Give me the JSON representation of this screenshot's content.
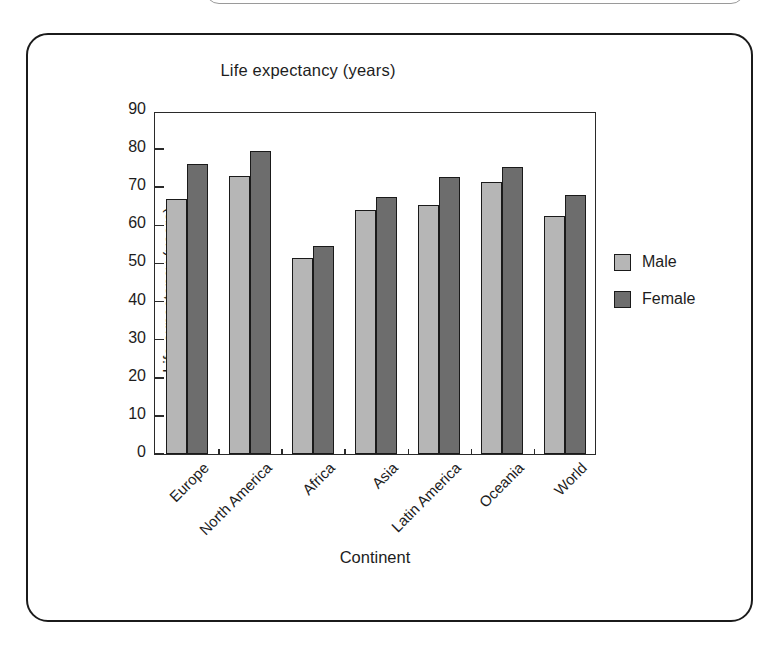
{
  "figure": {
    "title": "Life expectancy (years)"
  },
  "legend": {
    "position": "right",
    "items": [
      {
        "label": "Male",
        "color": "#b6b6b6"
      },
      {
        "label": "Female",
        "color": "#6d6d6d"
      }
    ]
  },
  "chart_data": {
    "type": "bar",
    "title": "Life expectancy (years)",
    "xlabel": "Continent",
    "ylabel": "Life expectancy (years)",
    "categories": [
      "Europe",
      "North America",
      "Africa",
      "Asia",
      "Latin America",
      "Oceania",
      "World"
    ],
    "series": [
      {
        "name": "Male",
        "color": "#b6b6b6",
        "values": [
          67.0,
          73.0,
          51.5,
          64.0,
          65.3,
          71.3,
          62.5
        ]
      },
      {
        "name": "Female",
        "color": "#6d6d6d",
        "values": [
          76.2,
          79.5,
          54.5,
          67.5,
          72.7,
          75.3,
          68.0
        ]
      }
    ],
    "ylim": [
      0,
      90
    ],
    "yticks": [
      0,
      10,
      20,
      30,
      40,
      50,
      60,
      70,
      80,
      90
    ],
    "ytick_labels": [
      "0",
      "10",
      "20",
      "30",
      "40",
      "50",
      "60",
      "70",
      "80",
      "90"
    ],
    "grid": false,
    "xtick_label_rotation": -45,
    "legend_position": "right"
  }
}
